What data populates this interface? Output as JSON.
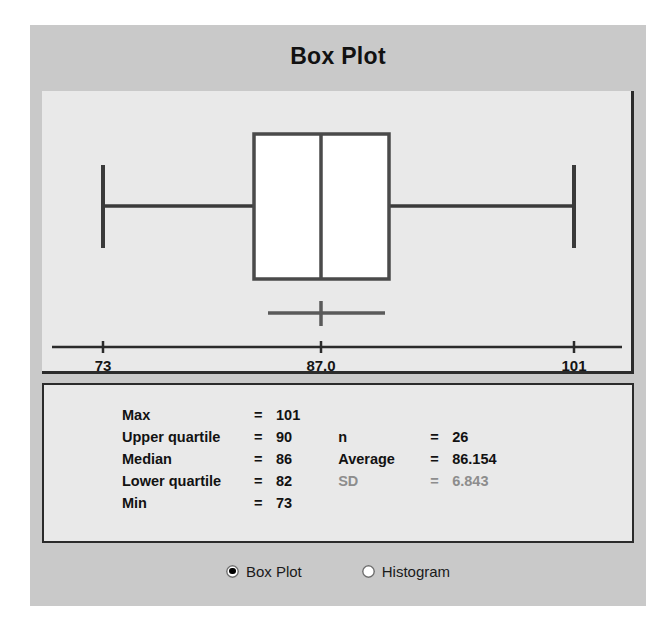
{
  "window": {
    "title": "Box Plot",
    "background_color": "#c9c9c9",
    "panel_color": "#e9e9e9"
  },
  "chart_data": {
    "type": "box",
    "title": "Box Plot",
    "xlabel": "",
    "ylabel": "",
    "orientation": "horizontal",
    "axis_ticks": [
      "73",
      "87.0",
      "101"
    ],
    "axis_tick_values": [
      73,
      87.0,
      101
    ],
    "xlim": [
      73,
      101
    ],
    "grid": false,
    "legend": "none",
    "box": {
      "min": 73,
      "lower_quartile": 82,
      "median": 86,
      "upper_quartile": 90,
      "max": 101
    },
    "mean_marker": {
      "average": 86.154,
      "sd": 6.843,
      "interval_low": 82.5,
      "interval_high": 89.8
    },
    "n": 26
  },
  "stats": {
    "left_column": [
      {
        "label": "Max",
        "eq": "=",
        "value": "101",
        "dim": false
      },
      {
        "label": "Upper quartile",
        "eq": "=",
        "value": "90",
        "dim": false
      },
      {
        "label": "Median",
        "eq": "=",
        "value": "86",
        "dim": false
      },
      {
        "label": "Lower quartile",
        "eq": "=",
        "value": "82",
        "dim": false
      },
      {
        "label": "Min",
        "eq": "=",
        "value": "73",
        "dim": false
      }
    ],
    "right_column": [
      {
        "label": "n",
        "eq": "=",
        "value": "26",
        "dim": false
      },
      {
        "label": "Average",
        "eq": "=",
        "value": "86.154",
        "dim": false
      },
      {
        "label": "SD",
        "eq": "=",
        "value": "6.843",
        "dim": true
      }
    ]
  },
  "mode_selector": {
    "options": [
      {
        "label": "Box Plot",
        "selected": true
      },
      {
        "label": "Histogram",
        "selected": false
      }
    ]
  }
}
